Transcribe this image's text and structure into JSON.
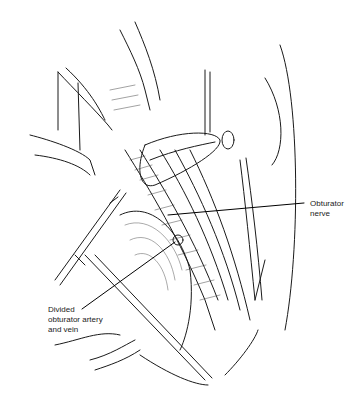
{
  "figure": {
    "type": "surgical anatomical line illustration",
    "background": "#ffffff",
    "ink_color": "#1a1a1a"
  },
  "labels": [
    {
      "id": "obturator-nerve",
      "text": "Obturator\nnerve"
    },
    {
      "id": "divided-obturator-artery-vein",
      "text": "Divided\nobturator artery\nand vein"
    }
  ]
}
